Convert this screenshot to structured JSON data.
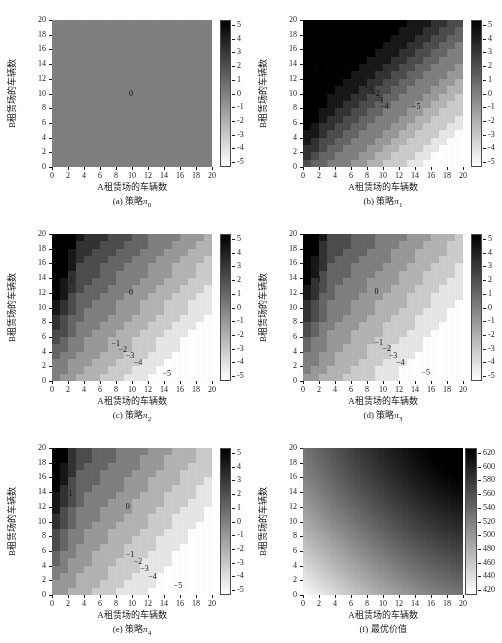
{
  "figure": {
    "width": 502,
    "height": 643,
    "background": "#ffffff",
    "axis_label_x": "A租赁场的车辆数",
    "axis_label_y": "B租赁场的车辆数"
  },
  "chart_data": [
    {
      "type": "heatmap",
      "panel": "a",
      "title": "(a) 策略",
      "title_sub": "0",
      "title_symbol": "π",
      "xlabel": "A租赁场的车辆数",
      "ylabel": "B租赁场的车辆数",
      "xticks": [
        0,
        2,
        4,
        6,
        8,
        10,
        12,
        14,
        16,
        18,
        20
      ],
      "yticks": [
        0,
        2,
        4,
        6,
        8,
        10,
        12,
        14,
        16,
        18,
        20
      ],
      "xlim": [
        0,
        20
      ],
      "ylim": [
        0,
        20
      ],
      "zlim": [
        -5,
        5
      ],
      "colorbar_ticks": [
        5,
        4,
        3,
        2,
        1,
        0,
        -1,
        -2,
        -3,
        -4,
        -5
      ],
      "colormap": "gray_reversed",
      "grid": false,
      "contour_labels": [
        {
          "text": "0",
          "x": 10,
          "y": 10
        }
      ],
      "note": "uniform zero policy — entire state space is action 0",
      "field": "zero"
    },
    {
      "type": "heatmap",
      "panel": "b",
      "title": "(b) 策略",
      "title_sub": "1",
      "title_symbol": "π",
      "xlabel": "A租赁场的车辆数",
      "ylabel": "B租赁场的车辆数",
      "xticks": [
        0,
        2,
        4,
        6,
        8,
        10,
        12,
        14,
        16,
        18,
        20
      ],
      "yticks": [
        0,
        2,
        4,
        6,
        8,
        10,
        12,
        14,
        16,
        18,
        20
      ],
      "xlim": [
        0,
        20
      ],
      "ylim": [
        0,
        20
      ],
      "zlim": [
        -5,
        5
      ],
      "colorbar_ticks": [
        5,
        4,
        3,
        2,
        1,
        0,
        -1,
        -2,
        -3,
        -4,
        -5
      ],
      "colormap": "gray_reversed",
      "grid": false,
      "contour_labels": [
        {
          "text": "2",
          "x": 1.6,
          "y": 13.6
        },
        {
          "text": "1",
          "x": 3.1,
          "y": 12.9
        },
        {
          "text": "0",
          "x": 5.6,
          "y": 11.1
        },
        {
          "text": "−1",
          "x": 8.1,
          "y": 10.7
        },
        {
          "text": "−2",
          "x": 8.9,
          "y": 9.9
        },
        {
          "text": "−3",
          "x": 9.3,
          "y": 9.0
        },
        {
          "text": "−4",
          "x": 10.0,
          "y": 8.1
        },
        {
          "text": "−5",
          "x": 14.0,
          "y": 8.1
        }
      ],
      "field": "policy1"
    },
    {
      "type": "heatmap",
      "panel": "c",
      "title": "(c) 策略",
      "title_sub": "2",
      "title_symbol": "π",
      "xlabel": "A租赁场的车辆数",
      "ylabel": "B租赁场的车辆数",
      "xticks": [
        0,
        2,
        4,
        6,
        8,
        10,
        12,
        14,
        16,
        18,
        20
      ],
      "yticks": [
        0,
        2,
        4,
        6,
        8,
        10,
        12,
        14,
        16,
        18,
        20
      ],
      "xlim": [
        0,
        20
      ],
      "ylim": [
        0,
        20
      ],
      "zlim": [
        -5,
        5
      ],
      "colorbar_ticks": [
        5,
        4,
        3,
        2,
        1,
        0,
        -1,
        -2,
        -3,
        -4,
        -5
      ],
      "colormap": "gray_reversed",
      "grid": false,
      "contour_labels": [
        {
          "text": "1",
          "x": 2.6,
          "y": 13.6
        },
        {
          "text": "0",
          "x": 10.0,
          "y": 12.0
        },
        {
          "text": "−1",
          "x": 7.8,
          "y": 5.0
        },
        {
          "text": "−2",
          "x": 8.7,
          "y": 4.2
        },
        {
          "text": "−3",
          "x": 9.6,
          "y": 3.4
        },
        {
          "text": "−4",
          "x": 10.6,
          "y": 2.5
        },
        {
          "text": "−5",
          "x": 14.2,
          "y": 0.9
        }
      ],
      "field": "policy2"
    },
    {
      "type": "heatmap",
      "panel": "d",
      "title": "(d) 策略",
      "title_sub": "3",
      "title_symbol": "π",
      "xlabel": "A租赁场的车辆数",
      "ylabel": "B租赁场的车辆数",
      "xticks": [
        0,
        2,
        4,
        6,
        8,
        10,
        12,
        14,
        16,
        18,
        20
      ],
      "yticks": [
        0,
        2,
        4,
        6,
        8,
        10,
        12,
        14,
        16,
        18,
        20
      ],
      "xlim": [
        0,
        20
      ],
      "ylim": [
        0,
        20
      ],
      "zlim": [
        -5,
        5
      ],
      "colorbar_ticks": [
        5,
        4,
        3,
        2,
        1,
        0,
        -1,
        -2,
        -3,
        -4,
        -5
      ],
      "colormap": "gray_reversed",
      "grid": false,
      "contour_labels": [
        {
          "text": "1",
          "x": 2.2,
          "y": 13.8
        },
        {
          "text": "0",
          "x": 9.3,
          "y": 12.1
        },
        {
          "text": "−1",
          "x": 9.3,
          "y": 5.2
        },
        {
          "text": "−2",
          "x": 10.3,
          "y": 4.3
        },
        {
          "text": "−3",
          "x": 11.1,
          "y": 3.4
        },
        {
          "text": "−4",
          "x": 12.0,
          "y": 2.4
        },
        {
          "text": "−5",
          "x": 15.2,
          "y": 1.1
        }
      ],
      "field": "policy3"
    },
    {
      "type": "heatmap",
      "panel": "e",
      "title": "(e) 策略",
      "title_sub": "4",
      "title_symbol": "π",
      "xlabel": "A租赁场的车辆数",
      "ylabel": "B租赁场的车辆数",
      "xticks": [
        0,
        2,
        4,
        6,
        8,
        10,
        12,
        14,
        16,
        18,
        20
      ],
      "yticks": [
        0,
        2,
        4,
        6,
        8,
        10,
        12,
        14,
        16,
        18,
        20
      ],
      "xlim": [
        0,
        20
      ],
      "ylim": [
        0,
        20
      ],
      "zlim": [
        -5,
        5
      ],
      "colorbar_ticks": [
        5,
        4,
        3,
        2,
        1,
        0,
        -1,
        -2,
        -3,
        -4,
        -5
      ],
      "colormap": "gray_reversed",
      "grid": false,
      "contour_labels": [
        {
          "text": "1",
          "x": 2.4,
          "y": 13.7
        },
        {
          "text": "0",
          "x": 9.6,
          "y": 12.0
        },
        {
          "text": "−1",
          "x": 9.6,
          "y": 5.4
        },
        {
          "text": "−2",
          "x": 10.6,
          "y": 4.5
        },
        {
          "text": "−3",
          "x": 11.4,
          "y": 3.6
        },
        {
          "text": "−4",
          "x": 12.4,
          "y": 2.5
        },
        {
          "text": "−5",
          "x": 15.6,
          "y": 1.2
        }
      ],
      "field": "policy4"
    },
    {
      "type": "heatmap",
      "panel": "f",
      "title": "(f) 最优价值",
      "title_sub": "",
      "title_symbol": "",
      "xlabel": "A租赁场的车辆数",
      "ylabel": "B租赁场的车辆数",
      "xticks": [
        0,
        2,
        4,
        6,
        8,
        10,
        12,
        14,
        16,
        18,
        20
      ],
      "yticks": [
        0,
        2,
        4,
        6,
        8,
        10,
        12,
        14,
        16,
        18,
        20
      ],
      "xlim": [
        0,
        20
      ],
      "ylim": [
        0,
        20
      ],
      "zlim": [
        410,
        625
      ],
      "colorbar_ticks": [
        620,
        600,
        580,
        560,
        540,
        520,
        500,
        480,
        460,
        440,
        420
      ],
      "colormap": "gray_reversed",
      "grid": false,
      "contour_labels": [],
      "field": "value"
    }
  ]
}
